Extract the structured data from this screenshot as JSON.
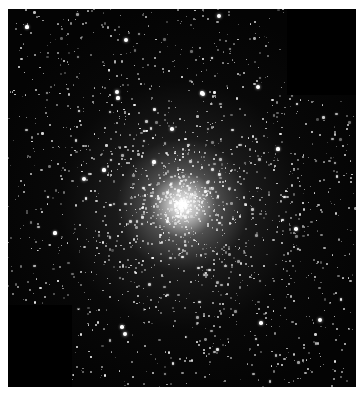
{
  "image": {
    "subject": "globular star cluster",
    "background_color": "#040404",
    "border_color": "#ffffff"
  },
  "frame": {
    "x": 8,
    "y": 9,
    "width": 348,
    "height": 378
  },
  "core": {
    "cx": 175,
    "cy": 196,
    "core_radius": 22,
    "halo_radius": 95,
    "outer_radius": 200
  },
  "dark_patches": [
    {
      "name": "top-right-patch",
      "x": 279,
      "y": 0,
      "width": 69,
      "height": 86
    },
    {
      "name": "bottom-left-patch",
      "x": 0,
      "y": 296,
      "width": 64,
      "height": 82
    }
  ],
  "bright_stars": [
    {
      "x": 211,
      "y": 7,
      "r": 2.2
    },
    {
      "x": 109,
      "y": 83,
      "r": 2.0
    },
    {
      "x": 195,
      "y": 85,
      "r": 2.0
    },
    {
      "x": 250,
      "y": 78,
      "r": 2.0
    },
    {
      "x": 194,
      "y": 84,
      "r": 1.6
    },
    {
      "x": 76,
      "y": 170,
      "r": 2.0
    },
    {
      "x": 96,
      "y": 161,
      "r": 1.6
    },
    {
      "x": 110,
      "y": 89,
      "r": 1.6
    },
    {
      "x": 118,
      "y": 31,
      "r": 2.0
    },
    {
      "x": 117,
      "y": 325,
      "r": 2.2
    },
    {
      "x": 114,
      "y": 318,
      "r": 1.8
    },
    {
      "x": 312,
      "y": 311,
      "r": 2.0
    },
    {
      "x": 253,
      "y": 314,
      "r": 1.8
    },
    {
      "x": 47,
      "y": 224,
      "r": 1.6
    },
    {
      "x": 19,
      "y": 18,
      "r": 1.6
    },
    {
      "x": 288,
      "y": 220,
      "r": 1.8
    },
    {
      "x": 270,
      "y": 140,
      "r": 1.6
    },
    {
      "x": 164,
      "y": 120,
      "r": 1.8
    },
    {
      "x": 146,
      "y": 153,
      "r": 1.6
    }
  ],
  "starfield": {
    "seed": 7,
    "field_count": 900,
    "cluster_count": 1400
  }
}
